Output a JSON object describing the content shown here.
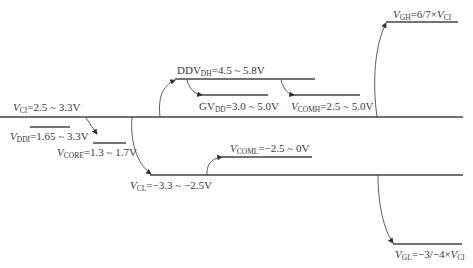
{
  "diagram": {
    "type": "voltage-level diagram",
    "labels": {
      "vci": {
        "var": "V",
        "sub": "CI",
        "value": "=2.5 ~ 3.3V"
      },
      "vddi": {
        "var": "V",
        "sub": "DDI",
        "value": "=1.65 ~ 3.3V"
      },
      "vcore": {
        "var": "V",
        "sub": "CORE",
        "value": "=1.3 ~ 1.7V"
      },
      "ddvdh": {
        "var": "DDV",
        "sub": "DH",
        "value": "=4.5 ~ 5.8V"
      },
      "gvdd": {
        "var": "GV",
        "sub": "DD",
        "value": "=3.0 ~ 5.0V"
      },
      "vcomh": {
        "var": "V",
        "sub": "COMH",
        "value": "=2.5 ~ 5.0V"
      },
      "vgh": {
        "var": "V",
        "sub": "GH",
        "value": "=6/7×",
        "var2": "V",
        "sub2": "CI"
      },
      "vcoml": {
        "var": "V",
        "sub": "COML",
        "value": "=−2.5 ~ 0V"
      },
      "vcl": {
        "var": "V",
        "sub": "CL",
        "value": "=−3.3 ~ −2.5V"
      },
      "vgl": {
        "var": "V",
        "sub": "GL",
        "value": "=−3/−4×",
        "var2": "V",
        "sub2": "CI"
      }
    },
    "colors": {
      "line": "#444444",
      "arrow": "#333333",
      "text": "#3a3a3a"
    }
  }
}
